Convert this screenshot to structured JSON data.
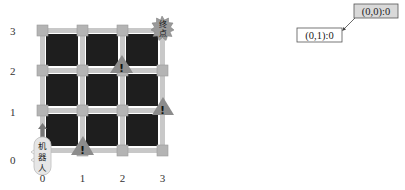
{
  "grid": {
    "x_labels": [
      "0",
      "1",
      "2",
      "3"
    ],
    "y_labels": [
      "0",
      "1",
      "2",
      "3"
    ],
    "cell_color": "#1e1e1e",
    "road_color": "#c8c8c8",
    "node_color": "#b4b4b4"
  },
  "robot": {
    "label_line1": "机",
    "label_line2": "器",
    "label_line3": "人",
    "position": "(0,0)",
    "direction": "up"
  },
  "goal": {
    "label_line1": "终",
    "label_line2": "点",
    "position": "(3,3)"
  },
  "hazards": [
    {
      "symbol": "!",
      "position": "between (1,0)"
    },
    {
      "symbol": "!",
      "position": "near (2,2)"
    },
    {
      "symbol": "!",
      "position": "near (3,1)"
    }
  ],
  "tree": {
    "root_label": "(0,0):0",
    "child_label": "(0,1):0"
  }
}
